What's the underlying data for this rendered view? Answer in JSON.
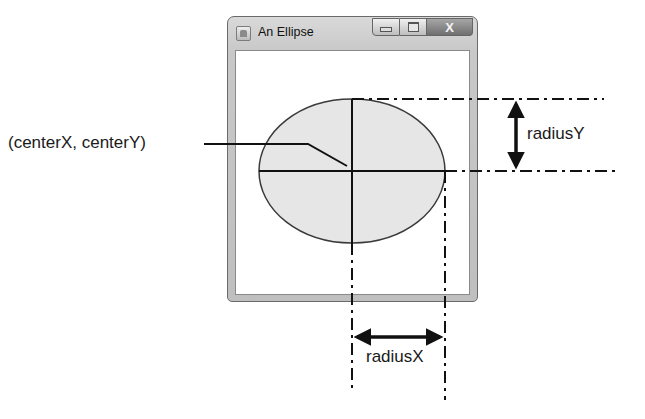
{
  "window": {
    "title": "An Ellipse",
    "icon": "java-cup-icon",
    "controls": {
      "minimize": "minimize-icon",
      "maximize": "maximize-icon",
      "close": "X"
    }
  },
  "ellipse": {
    "fill": "#e6e6e6",
    "stroke": "#3a3a3a"
  },
  "labels": {
    "center": "(centerX, centerY)",
    "radiusY": "radiusY",
    "radiusX": "radiusX"
  },
  "colors": {
    "line": "#111111",
    "frame": "#c4c4c4"
  }
}
